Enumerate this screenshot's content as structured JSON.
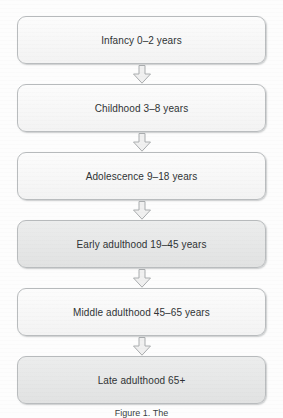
{
  "figure": {
    "type": "vertical-flowchart",
    "orientation": "top-to-bottom",
    "caption": "Figure 1. The",
    "colors": {
      "background": "#fdfdfd",
      "box_border": "#b9bcbe",
      "box_fill_light": "#f7f7f7",
      "box_fill_shaded": "#e6e7e7",
      "text": "#2f3335",
      "arrow_fill": "#f0f0f0",
      "arrow_stroke": "#a9acae"
    },
    "nodes": [
      {
        "id": "infancy",
        "label": "Infancy 0–2 years",
        "shade": "light"
      },
      {
        "id": "childhood",
        "label": "Childhood 3–8 years",
        "shade": "light"
      },
      {
        "id": "adolescence",
        "label": "Adolescence 9–18 years",
        "shade": "light"
      },
      {
        "id": "early-adulthood",
        "label": "Early adulthood 19–45 years",
        "shade": "shaded"
      },
      {
        "id": "middle-adulthood",
        "label": "Middle adulthood 45–65 years",
        "shade": "light"
      },
      {
        "id": "late-adulthood",
        "label": "Late adulthood 65+",
        "shade": "shaded"
      }
    ],
    "connectors": [
      {
        "id": "arrow-1",
        "from": "infancy",
        "to": "childhood",
        "glyph": "down-block-arrow"
      },
      {
        "id": "arrow-2",
        "from": "childhood",
        "to": "adolescence",
        "glyph": "down-block-arrow"
      },
      {
        "id": "arrow-3",
        "from": "adolescence",
        "to": "early-adulthood",
        "glyph": "down-block-arrow"
      },
      {
        "id": "arrow-4",
        "from": "early-adulthood",
        "to": "middle-adulthood",
        "glyph": "down-block-arrow"
      },
      {
        "id": "arrow-5",
        "from": "middle-adulthood",
        "to": "late-adulthood",
        "glyph": "down-block-arrow"
      }
    ]
  }
}
